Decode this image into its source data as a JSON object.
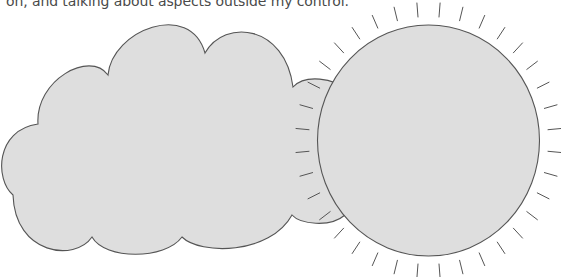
{
  "caption": {
    "text": "on, and talking about aspects outside my control."
  },
  "illustration": {
    "cloud": {
      "label": "cloud-shape",
      "fill": "#dedede",
      "stroke": "#555555"
    },
    "sun": {
      "label": "sun-shape",
      "fill": "#dedede",
      "stroke": "#555555",
      "ray_count": 36
    },
    "colors": {
      "text": "#4a4a4a",
      "background": "#ffffff"
    }
  }
}
